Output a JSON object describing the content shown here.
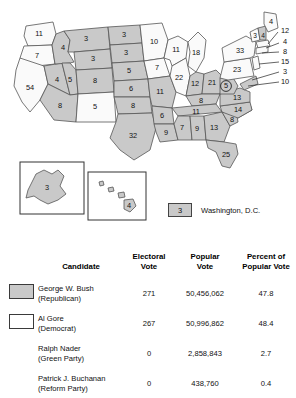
{
  "map": {
    "title": "2000 United States Presidential Election Electoral Map",
    "colors": {
      "bush_fill": "#c9c9c9",
      "gore_fill": "#fafafa",
      "border": "#555555"
    },
    "dc_legend": {
      "value": "3",
      "label": "Washington, D.C."
    },
    "insets": {
      "alaska_value": "3",
      "hawaii_value": "4"
    },
    "states": [
      {
        "code": "WA",
        "value": "11",
        "winner": "gore"
      },
      {
        "code": "OR",
        "value": "7",
        "winner": "gore"
      },
      {
        "code": "CA",
        "value": "54",
        "winner": "gore"
      },
      {
        "code": "NV",
        "value": "4",
        "winner": "bush"
      },
      {
        "code": "ID",
        "value": "4",
        "winner": "bush"
      },
      {
        "code": "MT",
        "value": "3",
        "winner": "bush"
      },
      {
        "code": "WY",
        "value": "3",
        "winner": "bush"
      },
      {
        "code": "UT",
        "value": "5",
        "winner": "bush"
      },
      {
        "code": "AZ",
        "value": "8",
        "winner": "bush"
      },
      {
        "code": "CO",
        "value": "8",
        "winner": "bush"
      },
      {
        "code": "NM",
        "value": "5",
        "winner": "gore"
      },
      {
        "code": "ND",
        "value": "3",
        "winner": "bush"
      },
      {
        "code": "SD",
        "value": "3",
        "winner": "bush"
      },
      {
        "code": "NE",
        "value": "5",
        "winner": "bush"
      },
      {
        "code": "KS",
        "value": "6",
        "winner": "bush"
      },
      {
        "code": "OK",
        "value": "8",
        "winner": "bush"
      },
      {
        "code": "TX",
        "value": "32",
        "winner": "bush"
      },
      {
        "code": "MN",
        "value": "10",
        "winner": "gore"
      },
      {
        "code": "IA",
        "value": "7",
        "winner": "gore"
      },
      {
        "code": "MO",
        "value": "11",
        "winner": "bush"
      },
      {
        "code": "AR",
        "value": "6",
        "winner": "bush"
      },
      {
        "code": "LA",
        "value": "9",
        "winner": "bush"
      },
      {
        "code": "WI",
        "value": "11",
        "winner": "gore"
      },
      {
        "code": "IL",
        "value": "22",
        "winner": "gore"
      },
      {
        "code": "MI",
        "value": "18",
        "winner": "gore"
      },
      {
        "code": "IN",
        "value": "12",
        "winner": "bush"
      },
      {
        "code": "OH",
        "value": "21",
        "winner": "bush"
      },
      {
        "code": "KY",
        "value": "8",
        "winner": "bush"
      },
      {
        "code": "TN",
        "value": "11",
        "winner": "bush"
      },
      {
        "code": "MS",
        "value": "7",
        "winner": "bush"
      },
      {
        "code": "AL",
        "value": "9",
        "winner": "bush"
      },
      {
        "code": "GA",
        "value": "13",
        "winner": "bush"
      },
      {
        "code": "FL",
        "value": "25",
        "winner": "bush"
      },
      {
        "code": "SC",
        "value": "8",
        "winner": "bush"
      },
      {
        "code": "NC",
        "value": "14",
        "winner": "bush"
      },
      {
        "code": "VA",
        "value": "13",
        "winner": "bush"
      },
      {
        "code": "WV",
        "value": "5",
        "winner": "bush"
      },
      {
        "code": "PA",
        "value": "23",
        "winner": "gore"
      },
      {
        "code": "NY",
        "value": "33",
        "winner": "gore"
      },
      {
        "code": "VT",
        "value": "3",
        "winner": "gore"
      },
      {
        "code": "NH",
        "value": "4",
        "winner": "bush"
      },
      {
        "code": "ME",
        "value": "4",
        "winner": "gore"
      }
    ],
    "callouts": [
      {
        "code": "MA",
        "value": "12"
      },
      {
        "code": "RI",
        "value": "4"
      },
      {
        "code": "CT",
        "value": "8"
      },
      {
        "code": "NJ",
        "value": "15"
      },
      {
        "code": "DE",
        "value": "3"
      },
      {
        "code": "MD",
        "value": "10"
      }
    ]
  },
  "table": {
    "headers": {
      "candidate": "Candidate",
      "electoral_vote": "Electoral\nVote",
      "electoral_vote_l1": "Electoral",
      "electoral_vote_l2": "Vote",
      "popular_vote_l1": "Popular",
      "popular_vote_l2": "Vote",
      "percent_l1": "Percent of",
      "percent_l2": "Popular Vote"
    },
    "rows": [
      {
        "name": "George W. Bush",
        "party": "(Republican)",
        "electoral": "271",
        "popular": "50,456,062",
        "percent": "47.8",
        "swatch": "bush"
      },
      {
        "name": "Al Gore",
        "party": "(Democrat)",
        "electoral": "267",
        "popular": "50,996,862",
        "percent": "48.4",
        "swatch": "gore"
      },
      {
        "name": "Ralph Nader",
        "party": "(Green Party)",
        "electoral": "0",
        "popular": "2,858,843",
        "percent": "2.7",
        "swatch": "none"
      },
      {
        "name": "Patrick J. Buchanan",
        "party": "(Reform Party)",
        "electoral": "0",
        "popular": "438,760",
        "percent": "0.4",
        "swatch": "none"
      }
    ]
  }
}
